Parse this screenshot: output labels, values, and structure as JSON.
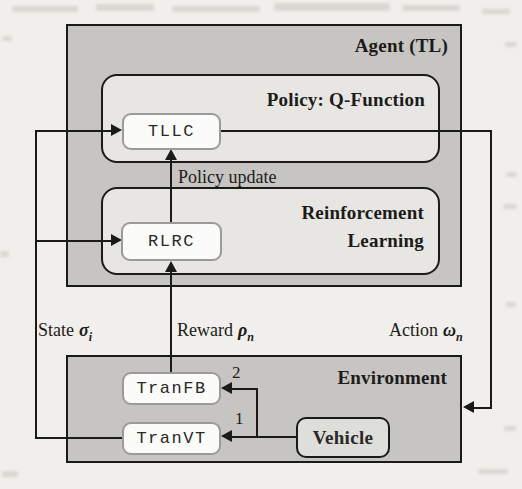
{
  "figure": {
    "agent": {
      "title": "Agent (TL)",
      "policy": {
        "title": "Policy: Q-Function",
        "node": "TLLC"
      },
      "rl": {
        "title_line1": "Reinforcement",
        "title_line2": "Learning",
        "node": "RLRC"
      },
      "policy_update": "Policy update"
    },
    "environment": {
      "title": "Environment",
      "tranfb": "TranFB",
      "tranvt": "TranVT",
      "vehicle": "Vehicle"
    },
    "labels": {
      "state": {
        "text": "State",
        "symbol": "σ",
        "sub": "i"
      },
      "reward": {
        "text": "Reward",
        "symbol": "ρ",
        "sub": "n"
      },
      "action": {
        "text": "Action",
        "symbol": "ω",
        "sub": "n"
      }
    },
    "markers": {
      "one": "1",
      "two": "2"
    }
  },
  "colors": {
    "paper": "#f1efeb",
    "outer_bg": "#c6c5c2",
    "panel_bg": "#e7e6e3",
    "node_bg": "#fbfbf9",
    "node_border": "#9b9a96",
    "vehicle_bg": "#dededb",
    "line": "#1a1a18",
    "text": "#1c1b19"
  }
}
